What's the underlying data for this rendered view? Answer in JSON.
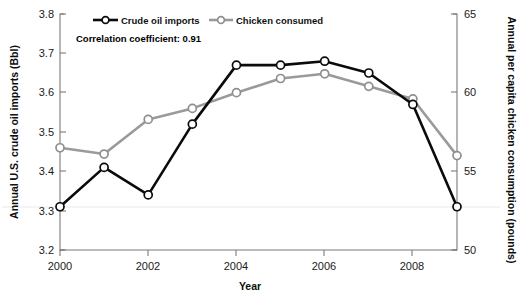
{
  "chart_data": {
    "type": "line",
    "title": "",
    "xlabel": "Year",
    "grid": "faint-horizontal",
    "legend_position": "top-inside",
    "x": [
      2000,
      2001,
      2002,
      2003,
      2004,
      2005,
      2006,
      2007,
      2008,
      2009
    ],
    "tick_labels_x": [
      "2000",
      "2002",
      "2004",
      "2006",
      "2008"
    ],
    "axes": [
      {
        "id": "left",
        "label": "Annual U.S. crude oil imports (Bbl)",
        "ticks": [
          "3.2",
          "3.3",
          "3.4",
          "3.5",
          "3.6",
          "3.7",
          "3.8"
        ],
        "lim": [
          3.2,
          3.8
        ]
      },
      {
        "id": "right",
        "label": "Annual per capita chicken consumption (pounds)",
        "ticks": [
          "50",
          "55",
          "60",
          "65"
        ],
        "lim": [
          50,
          65
        ]
      }
    ],
    "series": [
      {
        "name": "Crude oil imports",
        "axis": "left",
        "color": "#0b0b0b",
        "values": [
          3.31,
          3.41,
          3.34,
          3.52,
          3.67,
          3.67,
          3.68,
          3.65,
          3.57,
          3.31
        ]
      },
      {
        "name": "Chicken consumed",
        "axis": "right",
        "color": "#9a9a9a",
        "values": [
          56.5,
          56.1,
          58.3,
          59.0,
          60.0,
          60.9,
          61.2,
          60.4,
          59.6,
          56.0
        ]
      }
    ],
    "annotations": [
      {
        "id": "correlation",
        "text": "Correlation coefficient: 0.91"
      }
    ]
  },
  "legend": {
    "items": [
      {
        "label": "Crude oil imports"
      },
      {
        "label": "Chicken consumed"
      }
    ]
  }
}
